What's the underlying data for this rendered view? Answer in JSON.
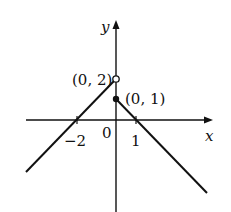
{
  "diagram": {
    "type": "piecewise-linear-graph",
    "axes": {
      "x_label": "x",
      "y_label": "y",
      "origin_label": "0"
    },
    "ticks": [
      {
        "value": -2,
        "label": "−2"
      },
      {
        "value": 1,
        "label": "1"
      }
    ],
    "points": [
      {
        "label": "(0, 2)",
        "x": 0,
        "y": 2,
        "style": "open"
      },
      {
        "label": "(0, 1)",
        "x": 0,
        "y": 1,
        "style": "filled"
      }
    ],
    "segments": [
      {
        "name": "left-branch",
        "description": "line through (-2,0) ending at open point (0,2)",
        "slope": 1
      },
      {
        "name": "right-branch",
        "description": "line from filled point (0,1) through (1,0)",
        "slope": -1
      }
    ],
    "colors": {
      "line": "#111111",
      "background": "#ffffff"
    }
  }
}
